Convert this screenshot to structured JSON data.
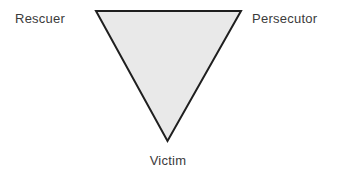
{
  "diagram": {
    "name": "drama-triangle",
    "background_color": "#ffffff",
    "shape": {
      "type": "inverted-triangle",
      "fill_color": "#e9e9e9",
      "stroke_color": "#1f1f1f",
      "stroke_width": 2,
      "vertices": [
        {
          "name": "top-left",
          "x": 96,
          "y": 11
        },
        {
          "name": "top-right",
          "x": 241,
          "y": 11
        },
        {
          "name": "bottom",
          "x": 167.5,
          "y": 141
        }
      ]
    },
    "labels": {
      "text_color": "#3b3b3b",
      "font_size_px": 13,
      "rescuer": "Rescuer",
      "persecutor": "Persecutor",
      "victim": "Victim"
    }
  }
}
